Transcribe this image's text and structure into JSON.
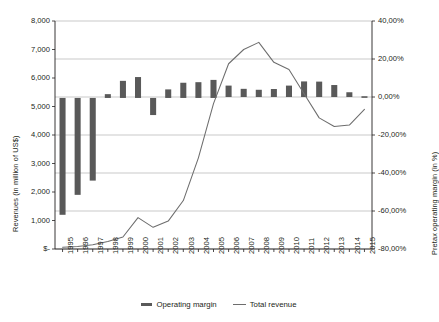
{
  "chart_data": {
    "type": "bar",
    "title": "",
    "subtitle": "",
    "xlabel": "",
    "ylabel": "Revenues (in million of US$)",
    "y2label": "Pretax operating margin (in %)",
    "grid": true,
    "legend_position": "bottom",
    "categories": [
      "1995",
      "1996",
      "1997",
      "1998",
      "1999",
      "2000",
      "2001",
      "2002",
      "2003",
      "2004",
      "2005",
      "2006",
      "2007",
      "2008",
      "2009",
      "2010",
      "2011",
      "2012",
      "2013",
      "2014",
      "2015"
    ],
    "ylim": [
      0,
      8000
    ],
    "y2lim": [
      -80,
      40
    ],
    "y_ticks": [
      "$-",
      "1,000",
      "2,000",
      "3,000",
      "4,000",
      "5,000",
      "6,000",
      "7,000",
      "8,000"
    ],
    "y_tick_values": [
      0,
      1000,
      2000,
      3000,
      4000,
      5000,
      6000,
      7000,
      8000
    ],
    "y2_ticks": [
      "-80,00%",
      "-60,00%",
      "-40,00%",
      "-20,00%",
      "0,00%",
      "20,00%",
      "40,00%"
    ],
    "y2_tick_values": [
      -80,
      -60,
      -40,
      -20,
      0,
      20,
      40
    ],
    "series": [
      {
        "name": "Operating margin",
        "type": "bar-range",
        "axis": "right",
        "unit": "%",
        "color": "#595959",
        "ranges": [
          {
            "year": "1995",
            "low": -62.0,
            "high": -0.5
          },
          {
            "year": "1996",
            "low": -51.5,
            "high": -0.5
          },
          {
            "year": "1997",
            "low": -44.0,
            "high": -0.5
          },
          {
            "year": "1998",
            "low": -0.5,
            "high": 1.5
          },
          {
            "year": "1999",
            "low": -0.5,
            "high": 8.5
          },
          {
            "year": "2000",
            "low": -0.5,
            "high": 10.5
          },
          {
            "year": "2001",
            "low": -9.5,
            "high": -0.5
          },
          {
            "year": "2002",
            "low": -0.5,
            "high": 4.0
          },
          {
            "year": "2003",
            "low": -0.5,
            "high": 7.5
          },
          {
            "year": "2004",
            "low": -0.5,
            "high": 7.8
          },
          {
            "year": "2005",
            "low": -0.5,
            "high": 9.0
          },
          {
            "year": "2006",
            "low": 0.0,
            "high": 6.0
          },
          {
            "year": "2007",
            "low": 0.0,
            "high": 4.3
          },
          {
            "year": "2008",
            "low": 0.0,
            "high": 3.8
          },
          {
            "year": "2009",
            "low": 0.0,
            "high": 4.2
          },
          {
            "year": "2010",
            "low": 0.0,
            "high": 6.0
          },
          {
            "year": "2011",
            "low": 0.0,
            "high": 8.2
          },
          {
            "year": "2012",
            "low": 0.0,
            "high": 8.1
          },
          {
            "year": "2013",
            "low": 0.0,
            "high": 6.3
          },
          {
            "year": "2014",
            "low": 0.0,
            "high": 2.5
          },
          {
            "year": "2015",
            "low": 0.0,
            "high": 0.4
          }
        ]
      },
      {
        "name": "Total revenue",
        "type": "line",
        "axis": "left",
        "unit": "million US$",
        "color": "#6d6d6d",
        "values": [
          60,
          90,
          150,
          260,
          420,
          1100,
          760,
          980,
          1700,
          3200,
          5100,
          6500,
          7000,
          7250,
          6550,
          6300,
          5450,
          4600,
          4300,
          4350,
          4900
        ]
      }
    ]
  },
  "legend": {
    "items": [
      {
        "label": "Operating margin",
        "marker": "bar"
      },
      {
        "label": "Total revenue",
        "marker": "line"
      }
    ]
  }
}
